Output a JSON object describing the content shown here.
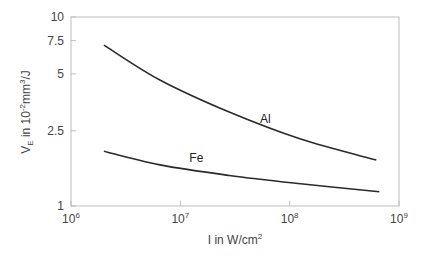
{
  "chart_data": {
    "type": "line",
    "title": "",
    "xlabel": "I in W/cm²",
    "ylabel": "V_E in 10^-2 mm^3/J",
    "xscale": "log",
    "yscale": "log",
    "xlim": [
      1000000,
      1000000000
    ],
    "ylim": [
      1,
      10
    ],
    "x_ticks": [
      {
        "value": 1000000,
        "base": "10",
        "exp": "6"
      },
      {
        "value": 10000000,
        "base": "10",
        "exp": "7"
      },
      {
        "value": 100000000,
        "base": "10",
        "exp": "8"
      },
      {
        "value": 1000000000,
        "base": "10",
        "exp": "9"
      }
    ],
    "y_ticks": [
      {
        "value": 1,
        "label": "1"
      },
      {
        "value": 2.5,
        "label": "2.5"
      },
      {
        "value": 5,
        "label": "5"
      },
      {
        "value": 7.5,
        "label": "7.5"
      },
      {
        "value": 10,
        "label": "10"
      }
    ],
    "grid": false,
    "legend": "inline labels",
    "series": [
      {
        "name": "Al",
        "label_at": {
          "x": 60000000,
          "y": 2.75
        },
        "x": [
          2000000,
          6500000,
          28000000,
          126000000,
          620000000
        ],
        "values": [
          7.1,
          4.64,
          3.14,
          2.26,
          1.75
        ]
      },
      {
        "name": "Fe",
        "label_at": {
          "x": 14000000,
          "y": 1.7
        },
        "x": [
          2000000,
          6500000,
          28000000,
          126000000,
          660000000
        ],
        "values": [
          1.95,
          1.65,
          1.45,
          1.31,
          1.19
        ]
      }
    ]
  },
  "axes": {
    "xlabel_main": "I in W/cm",
    "xlabel_sup": "2",
    "ylabel_v": "V",
    "ylabel_sub": "E",
    "ylabel_mid": " in 10",
    "ylabel_exp": "-2",
    "ylabel_unit": "mm",
    "ylabel_unit_exp": "3",
    "ylabel_tail": "/J"
  }
}
